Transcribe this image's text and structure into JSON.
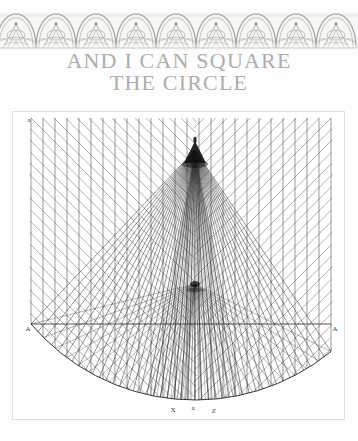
{
  "page": {
    "background_color": "#fdfdfd",
    "kind": "scanned-book-page"
  },
  "ornament": {
    "name": "arch-motif-band",
    "repeat_count": 9,
    "band_color": "#f3f2f0",
    "ink_color": "#8d8a86",
    "description": "repeating engraved arch and dome motif"
  },
  "title": {
    "line1": "AND I CAN SQUARE",
    "line2": "THE CIRCLE",
    "color": "#adadad"
  },
  "figure": {
    "frame_color": "#dededc",
    "ink_color": "#2b2b2b",
    "labels": {
      "top_left": "a",
      "bottom_left": "A",
      "bottom_right": "A",
      "bottom_center_left": "X",
      "bottom_center_mid": "a",
      "bottom_center_right": "Z"
    },
    "geometry": {
      "vertical_line_count": 25,
      "diagonal_line_count": 26,
      "fan_ray_count": 44,
      "apex_node": {
        "x": 182,
        "y": 38
      },
      "mid_node": {
        "x": 182,
        "y": 172
      },
      "arc_left": {
        "x": 18,
        "y": 212
      },
      "arc_right": {
        "x": 318,
        "y": 212
      },
      "arc_bottom": {
        "x": 182,
        "y": 288
      }
    }
  },
  "chart_data": {
    "type": "line",
    "title": "AND I CAN SQUARE THE CIRCLE",
    "xlabel": "",
    "ylabel": "",
    "categories": [
      "A",
      "X",
      "a",
      "Z",
      "A"
    ],
    "values": [
      212,
      288,
      288,
      288,
      212
    ],
    "legend": []
  }
}
